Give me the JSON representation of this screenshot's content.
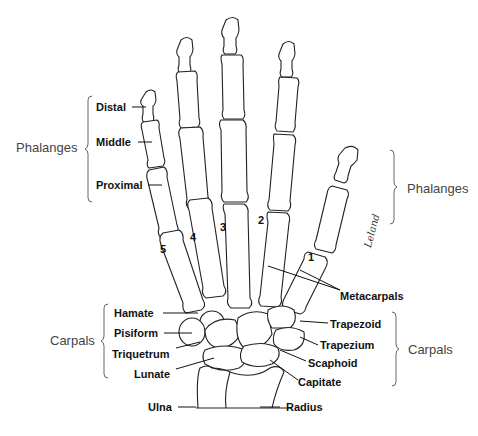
{
  "diagram": {
    "left_groups": {
      "phalanges": "Phalanges",
      "carpals": "Carpals"
    },
    "right_groups": {
      "phalanges": "Phalanges",
      "carpals": "Carpals"
    },
    "phalanx_labels": [
      "Distal",
      "Middle",
      "Proximal"
    ],
    "left_carpal_labels": [
      "Hamate",
      "Pisiform",
      "Triquetrum",
      "Lunate"
    ],
    "right_carpal_labels": [
      "Trapezoid",
      "Trapezium",
      "Scaphoid",
      "Capitate"
    ],
    "metacarpals": "Metacarpals",
    "forearm": {
      "ulna": "Ulna",
      "radius": "Radius"
    },
    "finger_numbers": [
      "1",
      "2",
      "3",
      "4",
      "5"
    ],
    "signature": "Leland"
  }
}
